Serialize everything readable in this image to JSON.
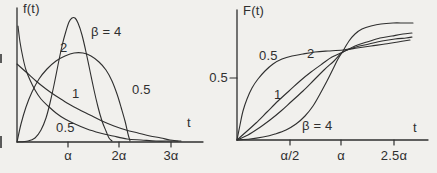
{
  "figure": {
    "width": 437,
    "height": 173,
    "background": "#f1f0ed",
    "ink": "#2f2f2f"
  },
  "chart_data": [
    {
      "type": "line",
      "title": "Weibull probability density functions",
      "ylabel": "f(t)",
      "xlabel": "t",
      "x_tick_labels": [
        "α",
        "2α",
        "3α"
      ],
      "x_unit": "multiples of α",
      "grid": false,
      "legend_position": "inline-curve-labels",
      "series": [
        {
          "name": "β = 0.5",
          "x": [
            0.05,
            0.1,
            0.2,
            0.4,
            0.7,
            1,
            1.5,
            2,
            2.5,
            3
          ],
          "y": [
            1.79,
            1.15,
            0.71,
            0.42,
            0.26,
            0.18,
            0.12,
            0.09,
            0.07,
            0.05
          ]
        },
        {
          "name": "β = 1",
          "x": [
            0,
            0.25,
            0.5,
            1,
            1.5,
            2,
            2.5,
            3
          ],
          "y": [
            1.0,
            0.78,
            0.61,
            0.37,
            0.22,
            0.14,
            0.08,
            0.05
          ]
        },
        {
          "name": "β = 2",
          "x": [
            0,
            0.25,
            0.5,
            0.71,
            1,
            1.25,
            1.5,
            1.75,
            2
          ],
          "y": [
            0,
            0.47,
            0.78,
            0.86,
            0.74,
            0.52,
            0.32,
            0.16,
            0.07
          ]
        },
        {
          "name": "β = 4",
          "x": [
            0,
            0.5,
            0.75,
            0.93,
            1,
            1.1,
            1.25,
            1.4,
            1.5
          ],
          "y": [
            0,
            0.47,
            1.23,
            1.52,
            1.47,
            1.23,
            0.68,
            0.24,
            0.09
          ]
        }
      ]
    },
    {
      "type": "line",
      "title": "Weibull cumulative distribution functions",
      "ylabel": "F(t)",
      "xlabel": "t",
      "x_tick_labels": [
        "α/2",
        "α",
        "2.5α"
      ],
      "y_tick_labels": [
        "0.5"
      ],
      "y_range": [
        0,
        1
      ],
      "x_unit": "multiples of α",
      "grid": false,
      "legend_position": "inline-curve-labels",
      "series": [
        {
          "name": "β = 0.5",
          "x": [
            0,
            0.1,
            0.25,
            0.5,
            1,
            1.5,
            2,
            2.5,
            3
          ],
          "y": [
            0,
            0.27,
            0.39,
            0.51,
            0.63,
            0.71,
            0.76,
            0.79,
            0.82
          ]
        },
        {
          "name": "β = 1",
          "x": [
            0,
            0.25,
            0.5,
            1,
            1.5,
            2,
            2.5,
            3
          ],
          "y": [
            0,
            0.22,
            0.39,
            0.63,
            0.78,
            0.86,
            0.92,
            0.95
          ]
        },
        {
          "name": "β = 2",
          "x": [
            0,
            0.25,
            0.5,
            0.75,
            1,
            1.25,
            1.5,
            2,
            2.5
          ],
          "y": [
            0,
            0.06,
            0.22,
            0.43,
            0.63,
            0.79,
            0.89,
            0.98,
            1.0
          ]
        },
        {
          "name": "β = 4",
          "x": [
            0,
            0.25,
            0.5,
            0.75,
            1,
            1.25,
            1.5,
            2
          ],
          "y": [
            0,
            0.004,
            0.06,
            0.27,
            0.63,
            0.91,
            0.99,
            1.0
          ]
        }
      ]
    }
  ],
  "left_chart": {
    "axis": {
      "x0": 17,
      "y0": 142,
      "x1": 203,
      "y_top": 8
    },
    "x_ticks": [
      {
        "x": 68,
        "label": "α"
      },
      {
        "x": 119,
        "label": "2α"
      },
      {
        "x": 171,
        "label": "3α"
      }
    ],
    "tick_label_y": 149,
    "labels": [
      {
        "name": "left-y-axis-title",
        "text": "f(t)",
        "x": 23,
        "y": 2
      },
      {
        "name": "left-x-axis-title",
        "text": "t",
        "x": 187,
        "y": 116
      },
      {
        "name": "left-curve-label-beta4",
        "text": "β = 4",
        "x": 91,
        "y": 25
      },
      {
        "name": "left-curve-label-beta2",
        "text": "2",
        "x": 60,
        "y": 41
      },
      {
        "name": "left-curve-label-beta1",
        "text": "1",
        "x": 72,
        "y": 87
      },
      {
        "name": "left-curve-label-beta05-a",
        "text": "0.5",
        "x": 56,
        "y": 121
      },
      {
        "name": "left-curve-label-beta05-b",
        "text": "0.5",
        "x": 132,
        "y": 83
      }
    ],
    "curves": [
      {
        "name": "pdf-beta-0.5",
        "points": [
          [
            18,
            26
          ],
          [
            20,
            42
          ],
          [
            23,
            58
          ],
          [
            26,
            70
          ],
          [
            30,
            80
          ],
          [
            35,
            90
          ],
          [
            41,
            99
          ],
          [
            48,
            106
          ],
          [
            56,
            113
          ],
          [
            65,
            119
          ],
          [
            75,
            124
          ],
          [
            87,
            129
          ],
          [
            100,
            133
          ],
          [
            113,
            136
          ],
          [
            127,
            139
          ],
          [
            141,
            140
          ],
          [
            156,
            141
          ],
          [
            170,
            141
          ],
          [
            181,
            141
          ]
        ]
      },
      {
        "name": "pdf-beta-1",
        "points": [
          [
            17,
            64
          ],
          [
            26,
            72
          ],
          [
            36,
            81
          ],
          [
            46,
            89
          ],
          [
            56,
            96
          ],
          [
            67,
            103
          ],
          [
            78,
            109
          ],
          [
            90,
            115
          ],
          [
            102,
            121
          ],
          [
            114,
            126
          ],
          [
            126,
            130
          ],
          [
            138,
            133
          ],
          [
            150,
            136
          ],
          [
            161,
            138
          ],
          [
            170,
            140
          ],
          [
            178,
            141
          ]
        ]
      },
      {
        "name": "pdf-beta-2",
        "points": [
          [
            17,
            142
          ],
          [
            21,
            124
          ],
          [
            26,
            107
          ],
          [
            32,
            92
          ],
          [
            39,
            79
          ],
          [
            47,
            69
          ],
          [
            56,
            61
          ],
          [
            65,
            56
          ],
          [
            74,
            53
          ],
          [
            83,
            53
          ],
          [
            91,
            56
          ],
          [
            99,
            62
          ],
          [
            106,
            70
          ],
          [
            112,
            81
          ],
          [
            117,
            94
          ],
          [
            121,
            107
          ],
          [
            125,
            121
          ],
          [
            128,
            134
          ],
          [
            130,
            141
          ]
        ]
      },
      {
        "name": "pdf-beta-4",
        "points": [
          [
            17,
            142
          ],
          [
            28,
            141
          ],
          [
            35,
            138
          ],
          [
            41,
            130
          ],
          [
            46,
            118
          ],
          [
            50,
            103
          ],
          [
            54,
            85
          ],
          [
            58,
            65
          ],
          [
            62,
            46
          ],
          [
            66,
            31
          ],
          [
            69,
            22
          ],
          [
            72,
            18
          ],
          [
            75,
            18
          ],
          [
            78,
            23
          ],
          [
            82,
            35
          ],
          [
            86,
            52
          ],
          [
            90,
            71
          ],
          [
            94,
            90
          ],
          [
            98,
            107
          ],
          [
            102,
            121
          ],
          [
            106,
            131
          ],
          [
            109,
            138
          ],
          [
            112,
            141
          ]
        ]
      }
    ]
  },
  "right_chart": {
    "axis": {
      "x0": 237,
      "y0": 140,
      "x1": 428,
      "y_top": 10
    },
    "x_ticks": [
      {
        "x": 290,
        "label": "α/2"
      },
      {
        "x": 341,
        "label": "α"
      },
      {
        "x": 394,
        "label": "2.5α"
      }
    ],
    "tick_label_y": 149,
    "y_ticks": [
      {
        "y": 78,
        "label": "0.5",
        "label_x": 202,
        "label_y": 71,
        "label_w": 26,
        "align": "right"
      }
    ],
    "labels": [
      {
        "name": "right-y-axis-title",
        "text": "F(t)",
        "x": 243,
        "y": 4
      },
      {
        "name": "right-x-axis-title",
        "text": "t",
        "x": 413,
        "y": 121
      },
      {
        "name": "right-curve-label-beta05",
        "text": "0.5",
        "x": 259,
        "y": 49
      },
      {
        "name": "right-curve-label-beta2",
        "text": "2",
        "x": 307,
        "y": 47
      },
      {
        "name": "right-curve-label-beta1",
        "text": "1",
        "x": 274,
        "y": 88
      },
      {
        "name": "right-curve-label-beta4",
        "text": "β = 4",
        "x": 302,
        "y": 119
      }
    ],
    "curves": [
      {
        "name": "cdf-beta-0.5",
        "points": [
          [
            237,
            140
          ],
          [
            240,
            125
          ],
          [
            243,
            111
          ],
          [
            247,
            99
          ],
          [
            252,
            88
          ],
          [
            258,
            79
          ],
          [
            265,
            71
          ],
          [
            273,
            64
          ],
          [
            282,
            59
          ],
          [
            292,
            56
          ],
          [
            303,
            54
          ],
          [
            315,
            52
          ],
          [
            328,
            51
          ],
          [
            343,
            50
          ],
          [
            357,
            48
          ],
          [
            371,
            46
          ],
          [
            385,
            44
          ],
          [
            398,
            42
          ],
          [
            410,
            40
          ]
        ]
      },
      {
        "name": "cdf-beta-1",
        "points": [
          [
            237,
            140
          ],
          [
            248,
            135
          ],
          [
            259,
            128
          ],
          [
            270,
            120
          ],
          [
            281,
            111
          ],
          [
            292,
            101
          ],
          [
            303,
            91
          ],
          [
            314,
            80
          ],
          [
            324,
            70
          ],
          [
            334,
            61
          ],
          [
            343,
            52
          ],
          [
            356,
            47
          ],
          [
            369,
            44
          ],
          [
            382,
            41
          ],
          [
            395,
            39
          ],
          [
            406,
            38
          ],
          [
            412,
            37
          ]
        ]
      },
      {
        "name": "cdf-beta-2",
        "points": [
          [
            237,
            140
          ],
          [
            246,
            132
          ],
          [
            256,
            123
          ],
          [
            267,
            112
          ],
          [
            278,
            101
          ],
          [
            289,
            91
          ],
          [
            300,
            81
          ],
          [
            311,
            72
          ],
          [
            322,
            64
          ],
          [
            332,
            57
          ],
          [
            343,
            52
          ],
          [
            355,
            46
          ],
          [
            367,
            42
          ],
          [
            380,
            38
          ],
          [
            392,
            36
          ],
          [
            403,
            34
          ],
          [
            412,
            33
          ]
        ]
      },
      {
        "name": "cdf-beta-4",
        "points": [
          [
            237,
            140
          ],
          [
            250,
            139
          ],
          [
            263,
            137
          ],
          [
            275,
            134
          ],
          [
            286,
            130
          ],
          [
            296,
            124
          ],
          [
            305,
            116
          ],
          [
            313,
            106
          ],
          [
            320,
            94
          ],
          [
            327,
            81
          ],
          [
            333,
            69
          ],
          [
            338,
            59
          ],
          [
            343,
            51
          ],
          [
            349,
            41
          ],
          [
            355,
            34
          ],
          [
            362,
            29
          ],
          [
            371,
            26
          ],
          [
            381,
            24
          ],
          [
            393,
            23
          ],
          [
            404,
            23
          ],
          [
            413,
            23
          ]
        ]
      }
    ]
  },
  "artifacts": [
    {
      "x": 0,
      "y": 54,
      "w": 2,
      "h": 9
    },
    {
      "x": 0,
      "y": 136,
      "w": 2,
      "h": 12
    }
  ]
}
